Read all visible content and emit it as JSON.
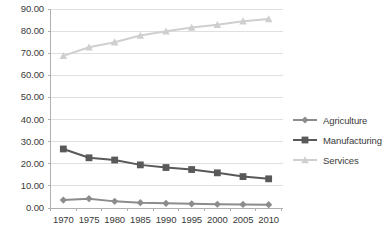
{
  "chart_data": {
    "type": "line",
    "title": "",
    "xlabel": "",
    "ylabel": "",
    "categories": [
      "1970",
      "1975",
      "1980",
      "1985",
      "1990",
      "1995",
      "2000",
      "2005",
      "2010"
    ],
    "series": [
      {
        "name": "Agriculture",
        "color": "#8c8c8c",
        "marker": "diamond",
        "values": [
          3.6,
          4.2,
          3.0,
          2.4,
          2.1,
          1.9,
          1.7,
          1.6,
          1.5
        ]
      },
      {
        "name": "Manufacturing",
        "color": "#595959",
        "marker": "square",
        "values": [
          26.7,
          22.7,
          21.7,
          19.5,
          18.3,
          17.4,
          15.9,
          14.2,
          13.2
        ]
      },
      {
        "name": "Services",
        "color": "#cfcfcf",
        "marker": "triangle",
        "values": [
          68.8,
          72.7,
          75.0,
          78.0,
          79.9,
          81.6,
          82.9,
          84.5,
          85.5
        ]
      }
    ],
    "ylim": [
      0,
      90
    ],
    "ytick_step": 10,
    "ytick_labels": [
      "0.00",
      "10.00",
      "20.00",
      "30.00",
      "40.00",
      "50.00",
      "60.00",
      "70.00",
      "80.00",
      "90.00"
    ],
    "grid": true,
    "grid_axis": "y",
    "grid_color": "#e0e0e0",
    "legend_position": "right",
    "axis_color": "#b0b0b0",
    "text_color": "#3a3a3a"
  },
  "legend": {
    "items": [
      {
        "label": "Agriculture"
      },
      {
        "label": "Manufacturing"
      },
      {
        "label": "Services"
      }
    ]
  }
}
